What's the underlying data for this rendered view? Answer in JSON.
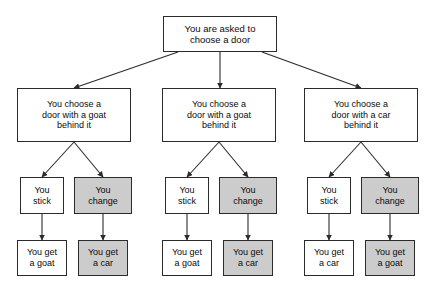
{
  "diagram": {
    "type": "decision-tree",
    "background_color": "#ffffff",
    "line_color": "#2b2b2b",
    "shaded_fill": "#cccccc",
    "plain_fill": "#ffffff",
    "text_color": "#0b0b0b"
  },
  "root": {
    "label": "You are asked to\nchoose a door"
  },
  "branches": [
    {
      "choice": {
        "label": "You choose a\ndoor with a goat\nbehind it"
      },
      "actions": [
        {
          "label": "You\nstick",
          "shaded": false,
          "outcome": {
            "label": "You get\na goat",
            "shaded": false
          }
        },
        {
          "label": "You\nchange",
          "shaded": true,
          "outcome": {
            "label": "You get\na car",
            "shaded": true
          }
        }
      ]
    },
    {
      "choice": {
        "label": "You choose a\ndoor with a goat\nbehind it"
      },
      "actions": [
        {
          "label": "You\nstick",
          "shaded": false,
          "outcome": {
            "label": "You get\na goat",
            "shaded": false
          }
        },
        {
          "label": "You\nchange",
          "shaded": true,
          "outcome": {
            "label": "You get\na car",
            "shaded": true
          }
        }
      ]
    },
    {
      "choice": {
        "label": "You choose a\ndoor with a car\nbehind it"
      },
      "actions": [
        {
          "label": "You\nstick",
          "shaded": false,
          "outcome": {
            "label": "You get\na car",
            "shaded": false
          }
        },
        {
          "label": "You\nchange",
          "shaded": true,
          "outcome": {
            "label": "You get\na goat",
            "shaded": true
          }
        }
      ]
    }
  ]
}
